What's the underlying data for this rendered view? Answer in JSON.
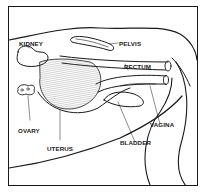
{
  "diagram": {
    "labels": {
      "kidney": "KIDNEY",
      "pelvis": "PELVIS",
      "rectum": "RECTUM",
      "ovary": "OVARY",
      "uterus": "UTERUS",
      "bladder": "BLADDER",
      "vagina": "VAGINA"
    },
    "colors": {
      "ink": "#1a1a1a",
      "background": "#ffffff"
    }
  }
}
